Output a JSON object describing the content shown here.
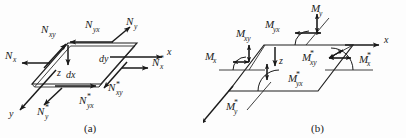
{
  "figure": {
    "background_color": "#fdfdfd",
    "ink_color": "#1a1a1a",
    "panels": [
      {
        "id": "a",
        "caption": "(a)",
        "description": "In-plane membrane force resultants on a plate element",
        "axes": [
          {
            "name": "x",
            "label": "x",
            "direction": "right"
          },
          {
            "name": "y",
            "label": "y",
            "direction": "down-left"
          },
          {
            "name": "z",
            "label": "z",
            "direction": "down"
          }
        ],
        "dimensions": [
          {
            "name": "dx",
            "label": "dx"
          },
          {
            "name": "dy",
            "label": "dy"
          }
        ],
        "force_labels": [
          {
            "base": "N",
            "sub": "x",
            "star": false,
            "text": "N_x"
          },
          {
            "base": "N",
            "sub": "xy",
            "star": false,
            "text": "N_xy"
          },
          {
            "base": "N",
            "sub": "y",
            "star": false,
            "text": "N_y"
          },
          {
            "base": "N",
            "sub": "yx",
            "star": false,
            "text": "N_yx"
          },
          {
            "base": "N",
            "sub": "x",
            "star": true,
            "text": "N_x*"
          },
          {
            "base": "N",
            "sub": "xy",
            "star": true,
            "text": "N_xy*"
          },
          {
            "base": "N",
            "sub": "y",
            "star": true,
            "text": "N_y*"
          },
          {
            "base": "N",
            "sub": "yx",
            "star": true,
            "text": "N_yx*"
          }
        ]
      },
      {
        "id": "b",
        "caption": "(b)",
        "description": "Bending and twisting moment resultants on a plate element",
        "axes": [
          {
            "name": "x",
            "label": "x",
            "direction": "right"
          },
          {
            "name": "y",
            "label": "y",
            "direction": "down-left"
          },
          {
            "name": "z",
            "label": "z",
            "direction": "down"
          }
        ],
        "dimensions": [],
        "moment_labels": [
          {
            "base": "M",
            "sub": "x",
            "star": false,
            "text": "M_x"
          },
          {
            "base": "M",
            "sub": "xy",
            "star": false,
            "text": "M_xy"
          },
          {
            "base": "M",
            "sub": "y",
            "star": false,
            "text": "M_y"
          },
          {
            "base": "M",
            "sub": "yx",
            "star": false,
            "text": "M_yx"
          },
          {
            "base": "M",
            "sub": "x",
            "star": true,
            "text": "M_x*"
          },
          {
            "base": "M",
            "sub": "xy",
            "star": true,
            "text": "M_xy*"
          },
          {
            "base": "M",
            "sub": "y",
            "star": true,
            "text": "M_y*"
          },
          {
            "base": "M",
            "sub": "yx",
            "star": true,
            "text": "M_yx*"
          }
        ]
      }
    ]
  },
  "panel_a": {
    "caption": "(a)",
    "axis_x": "x",
    "axis_y": "y",
    "axis_z": "z",
    "dim_dx": "dx",
    "dim_dy": "dy",
    "N": "N",
    "sub_x": "x",
    "sub_y": "y",
    "sub_xy": "xy",
    "sub_yx": "yx",
    "star": "*"
  },
  "panel_b": {
    "caption": "(b)",
    "axis_x": "x",
    "axis_y": "y",
    "axis_z": "z",
    "M": "M",
    "sub_x": "x",
    "sub_y": "y",
    "sub_xy": "xy",
    "sub_yx": "yx",
    "star": "*"
  }
}
